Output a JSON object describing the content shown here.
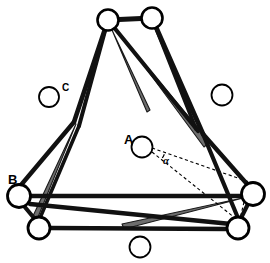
{
  "figure": {
    "background_color": "#ffffff",
    "width": 270,
    "height": 263,
    "bond_color": "#111111",
    "wedge_color": "#6e6e6e",
    "wedge_edge_color": "#1a1a1a",
    "atom_fill": "#ffffff",
    "atom_stroke": "#000000",
    "dashed_color": "#000000"
  },
  "labels": {
    "atom_a": "A",
    "atom_b": "B",
    "atom_c": "C",
    "angle": "α"
  },
  "chart_data": {
    "type": "diagram",
    "atoms": [
      {
        "id": "t1",
        "label": "",
        "x": 108,
        "y": 20,
        "r": 10.5,
        "stroke_width": 2.6,
        "bonded": true
      },
      {
        "id": "t2",
        "label": "",
        "x": 152,
        "y": 18,
        "r": 10.5,
        "stroke_width": 2.6,
        "bonded": true
      },
      {
        "id": "bl1",
        "label": "B",
        "x": 19,
        "y": 196,
        "r": 11.5,
        "stroke_width": 2.8,
        "bonded": true
      },
      {
        "id": "bl2",
        "label": "",
        "x": 39,
        "y": 228,
        "r": 11.0,
        "stroke_width": 2.8,
        "bonded": true
      },
      {
        "id": "br1",
        "label": "",
        "x": 253,
        "y": 194,
        "r": 11.5,
        "stroke_width": 2.8,
        "bonded": true
      },
      {
        "id": "br2",
        "label": "",
        "x": 238,
        "y": 228,
        "r": 11.0,
        "stroke_width": 2.8,
        "bonded": true
      },
      {
        "id": "fc",
        "label": "C",
        "x": 49,
        "y": 97,
        "r": 10.0,
        "stroke_width": 1.8,
        "bonded": false
      },
      {
        "id": "fr",
        "label": "",
        "x": 222,
        "y": 95,
        "r": 10.5,
        "stroke_width": 1.8,
        "bonded": false
      },
      {
        "id": "fa",
        "label": "A",
        "x": 142,
        "y": 147,
        "r": 10.5,
        "stroke_width": 1.8,
        "bonded": false
      },
      {
        "id": "fb",
        "label": "",
        "x": 140,
        "y": 247,
        "r": 10.5,
        "stroke_width": 1.8,
        "bonded": false
      }
    ],
    "label_positions": [
      {
        "text": "A",
        "x": 124,
        "y": 144,
        "size": "major"
      },
      {
        "text": "B",
        "x": 8,
        "y": 184,
        "size": "major"
      },
      {
        "text": "C",
        "x": 62,
        "y": 91,
        "size": "minor"
      },
      {
        "text": "α",
        "x": 163,
        "y": 164,
        "size": "angle"
      }
    ],
    "bonds_black": [
      {
        "from": [
          108,
          20
        ],
        "to": [
          152,
          18
        ],
        "width": 5.0
      },
      {
        "from": [
          108,
          20
        ],
        "to": [
          74,
          122
        ],
        "width": 4.6
      },
      {
        "from": [
          108,
          20
        ],
        "to": [
          79,
          126
        ],
        "width": 4.0
      },
      {
        "from": [
          152,
          18
        ],
        "to": [
          203,
          134
        ],
        "width": 4.8
      },
      {
        "from": [
          152,
          18
        ],
        "to": [
          196,
          129
        ],
        "width": 3.6
      },
      {
        "from": [
          108,
          20
        ],
        "to": [
          198,
          131
        ],
        "width": 4.2
      },
      {
        "from": [
          74,
          122
        ],
        "to": [
          21,
          185
        ],
        "width": 4.4
      },
      {
        "from": [
          203,
          134
        ],
        "to": [
          247,
          184
        ],
        "width": 4.4
      },
      {
        "from": [
          203,
          134
        ],
        "to": [
          238,
          218
        ],
        "width": 4.2
      },
      {
        "from": [
          79,
          126
        ],
        "to": [
          40,
          218
        ],
        "width": 3.6
      },
      {
        "from": [
          30,
          196
        ],
        "to": [
          245,
          196
        ],
        "width": 4.6
      },
      {
        "from": [
          30,
          204
        ],
        "to": [
          231,
          224
        ],
        "width": 4.4
      },
      {
        "from": [
          49,
          228
        ],
        "to": [
          228,
          229
        ],
        "width": 4.4
      },
      {
        "from": [
          24,
          206
        ],
        "to": [
          34,
          218
        ],
        "width": 4.2
      },
      {
        "from": [
          248,
          204
        ],
        "to": [
          241,
          218
        ],
        "width": 4.2
      }
    ],
    "wedges_grey": [
      {
        "apex": [
          112,
          30
        ],
        "base_a": [
          150,
          110
        ],
        "base_b": [
          147,
          112
        ],
        "note": "top-left to mid-right taper"
      },
      {
        "apex": [
          128,
          44
        ],
        "base_a": [
          210,
          142
        ],
        "base_b": [
          204,
          147
        ],
        "note": "long top to lower-right taper"
      },
      {
        "apex": [
          76,
          124
        ],
        "base_a": [
          38,
          217
        ],
        "base_b": [
          33,
          216
        ],
        "note": "mid-left down to lower-left taper"
      },
      {
        "apex": [
          247,
          197
        ],
        "base_a": [
          122,
          224
        ],
        "base_b": [
          124,
          229
        ],
        "note": "right across to lower-left taper"
      }
    ],
    "dashed_lines": [
      {
        "from": [
          152,
          148
        ],
        "to": [
          252,
          183
        ]
      },
      {
        "from": [
          152,
          152
        ],
        "to": [
          240,
          222
        ]
      },
      {
        "from": [
          248,
          185
        ],
        "to": [
          240,
          219
        ]
      }
    ],
    "angle_arc": {
      "center": [
        152,
        150
      ],
      "radius": 13,
      "start_deg": 19,
      "end_deg": 38,
      "label": "α"
    }
  }
}
